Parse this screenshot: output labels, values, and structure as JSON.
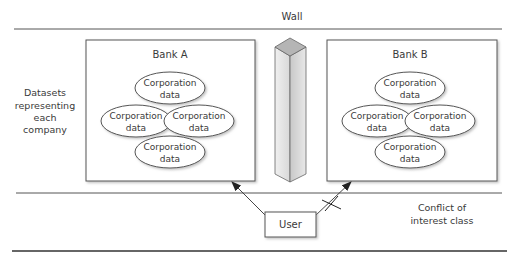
{
  "title": "Wall",
  "left_label": [
    "Datasets",
    "representing",
    "each",
    "company"
  ],
  "conflict_label": [
    "Conflict of",
    "interest class"
  ],
  "user_label": "User",
  "banks": [
    {
      "name": "Bank A",
      "datasets": [
        [
          "Corporation",
          "data"
        ],
        [
          "Corporation",
          "data"
        ],
        [
          "Corporation",
          "data"
        ],
        [
          "Corporation",
          "data"
        ]
      ]
    },
    {
      "name": "Bank B",
      "datasets": [
        [
          "Corporation",
          "data"
        ],
        [
          "Corporation",
          "data"
        ],
        [
          "Corporation",
          "data"
        ],
        [
          "Corporation",
          "data"
        ]
      ]
    }
  ],
  "access": [
    {
      "from": "User",
      "to": "Bank A",
      "allowed": true
    },
    {
      "from": "User",
      "to": "Bank B",
      "allowed": false
    }
  ],
  "colors": {
    "line": "#555555",
    "pillar_top": "#b8b8b8",
    "pillar_left": "#e2e2e2",
    "pillar_right": "#cfcfcf"
  }
}
